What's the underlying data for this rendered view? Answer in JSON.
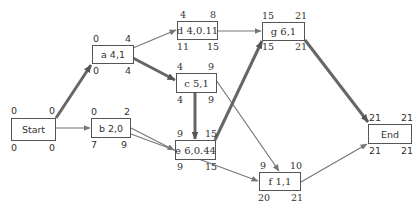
{
  "diagram": {
    "type": "activity-on-node network (critical path)",
    "colors": {
      "thin_arrow": "#777777",
      "critical_arrow": "#666666",
      "box_border": "#555555",
      "text": "#333333"
    },
    "nodes": [
      {
        "id": "start",
        "label": "Start",
        "es": "0",
        "ef": "0",
        "ls": "0",
        "lf": "0"
      },
      {
        "id": "a",
        "label": "a 4,1",
        "es": "0",
        "ef": "4",
        "ls": "0",
        "lf": "4"
      },
      {
        "id": "b",
        "label": "b 2,0",
        "es": "0",
        "ef": "2",
        "ls": "7",
        "lf": "9"
      },
      {
        "id": "c",
        "label": "c 5,1",
        "es": "4",
        "ef": "9",
        "ls": "4",
        "lf": "9"
      },
      {
        "id": "d",
        "label": "d 4,0.11",
        "es": "4",
        "ef": "8",
        "ls": "11",
        "lf": "15"
      },
      {
        "id": "e",
        "label": "e 6,0.44",
        "es": "9",
        "ef": "15",
        "ls": "9",
        "lf": "15"
      },
      {
        "id": "f",
        "label": "f 1,1",
        "es": "9",
        "ef": "10",
        "ls": "20",
        "lf": "21"
      },
      {
        "id": "g",
        "label": "g 6,1",
        "es": "15",
        "ef": "21",
        "ls": "15",
        "lf": "21"
      },
      {
        "id": "end",
        "label": "End",
        "es": "21",
        "ef": "21",
        "ls": "21",
        "lf": "21"
      }
    ],
    "edges": [
      {
        "from": "start",
        "to": "a",
        "critical": true
      },
      {
        "from": "start",
        "to": "b",
        "critical": false
      },
      {
        "from": "a",
        "to": "d",
        "critical": false
      },
      {
        "from": "a",
        "to": "c",
        "critical": true
      },
      {
        "from": "b",
        "to": "e",
        "critical": false
      },
      {
        "from": "b",
        "to": "f",
        "critical": false
      },
      {
        "from": "c",
        "to": "e",
        "critical": true
      },
      {
        "from": "c",
        "to": "f",
        "critical": false
      },
      {
        "from": "d",
        "to": "g",
        "critical": false
      },
      {
        "from": "e",
        "to": "g",
        "critical": true
      },
      {
        "from": "g",
        "to": "end",
        "critical": true
      },
      {
        "from": "f",
        "to": "end",
        "critical": false
      }
    ]
  }
}
